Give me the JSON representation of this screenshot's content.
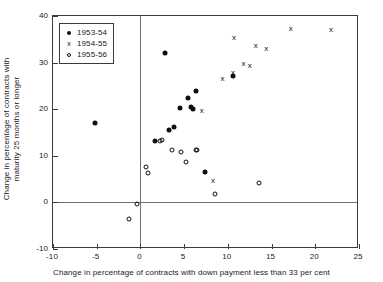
{
  "chart_data": {
    "type": "scatter",
    "title": "",
    "xlabel": "Change in percentage of contracts with down payment less than 33 per cent",
    "ylabel": "Change in percentage of contracts with\nmaturity 25 months or longer",
    "xlim": [
      -10,
      25
    ],
    "ylim": [
      -10,
      40
    ],
    "xticks": [
      -10,
      -5,
      0,
      5,
      10,
      15,
      20,
      25
    ],
    "yticks": [
      -10,
      0,
      10,
      20,
      30,
      40
    ],
    "xtick_labels": [
      "-10",
      "-5",
      "0",
      "5",
      "10",
      "15",
      "20",
      "25"
    ],
    "ytick_labels": [
      "-10",
      "0",
      "10",
      "20",
      "30",
      "40"
    ],
    "grid": false,
    "zero_lines": {
      "x": 0,
      "y": 0
    },
    "legend_position": "upper-left",
    "series": [
      {
        "name": "1953-54",
        "marker": "filled-circle",
        "color": "#101010",
        "points": [
          [
            -5.2,
            17.0
          ],
          [
            1.7,
            13.2
          ],
          [
            2.8,
            32.0
          ],
          [
            3.3,
            15.6
          ],
          [
            3.8,
            16.2
          ],
          [
            4.5,
            20.2
          ],
          [
            5.4,
            22.3
          ],
          [
            5.8,
            20.4
          ],
          [
            6.0,
            20.0
          ],
          [
            6.3,
            24.0
          ],
          [
            7.4,
            6.6
          ],
          [
            10.6,
            27.2
          ]
        ]
      },
      {
        "name": "1954-55",
        "marker": "cross",
        "color": "#101010",
        "points": [
          [
            7.0,
            19.8
          ],
          [
            8.3,
            4.9
          ],
          [
            9.4,
            26.8
          ],
          [
            10.6,
            28.0
          ],
          [
            10.7,
            35.6
          ],
          [
            11.8,
            30.0
          ],
          [
            12.5,
            29.4
          ],
          [
            13.2,
            33.7
          ],
          [
            14.4,
            33.2
          ],
          [
            17.2,
            37.5
          ],
          [
            21.8,
            37.2
          ]
        ]
      },
      {
        "name": "1955-56",
        "marker": "open-circle",
        "color": "#101010",
        "points": [
          [
            -1.3,
            -3.6
          ],
          [
            -0.4,
            -0.3
          ],
          [
            0.6,
            7.6
          ],
          [
            0.9,
            6.3
          ],
          [
            2.2,
            13.1
          ],
          [
            3.6,
            11.3
          ],
          [
            4.6,
            10.9
          ],
          [
            5.2,
            8.7
          ],
          [
            6.3,
            11.2
          ],
          [
            6.5,
            11.3
          ],
          [
            8.5,
            1.8
          ],
          [
            13.6,
            4.1
          ],
          [
            2.5,
            13.3
          ]
        ]
      }
    ]
  },
  "legend": {
    "items": [
      {
        "symbol": "filled-circle",
        "label": "1953-54"
      },
      {
        "symbol": "cross",
        "label": "1954-55"
      },
      {
        "symbol": "open-circle",
        "label": "1955-56"
      }
    ]
  }
}
